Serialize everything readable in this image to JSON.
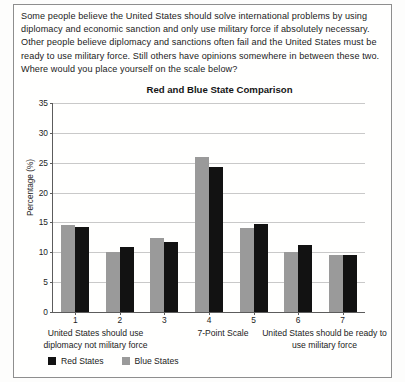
{
  "prompt": "Some people believe the United States should solve international problems by using diplomacy and economic sanction and only use military force if absolutely necessary. Other people believe diplomacy and sanctions often fail and the United States must be ready to use military force. Still others have opinions somewhere in between these two. Where would you place yourself on the scale below?",
  "captions": {
    "left": "United States should use diplomacy not military force",
    "middle": "7-Point Scale",
    "right": "United States should be ready to use military force"
  },
  "colors": {
    "red_states": "#121212",
    "blue_states": "#9a9a9a",
    "gridline": "#c9c9c9",
    "axis": "#5c5c5c",
    "frame": "#8e8e8e"
  },
  "chart_data": {
    "type": "bar",
    "title": "Red and Blue State Comparison",
    "xlabel": "7-Point Scale",
    "ylabel": "Percentage (%)",
    "categories": [
      "1",
      "2",
      "3",
      "4",
      "5",
      "6",
      "7"
    ],
    "ylim": [
      0,
      35
    ],
    "yticks": [
      0,
      5,
      10,
      15,
      20,
      25,
      30,
      35
    ],
    "grid": true,
    "legend_position": "below",
    "series": [
      {
        "name": "Red States",
        "color": "#121212",
        "values": [
          14.2,
          10.9,
          11.8,
          24.3,
          14.8,
          11.3,
          9.6
        ]
      },
      {
        "name": "Blue States",
        "color": "#9a9a9a",
        "values": [
          14.5,
          10.0,
          12.4,
          26.0,
          14.0,
          10.0,
          9.6
        ]
      }
    ]
  }
}
